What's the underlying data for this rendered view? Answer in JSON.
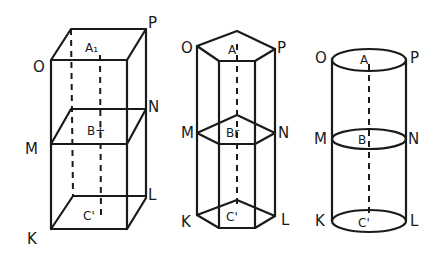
{
  "figures": [
    {
      "name": "rectangular-prism",
      "vertex_labels": {
        "O": "O",
        "P": "P",
        "N": "N",
        "M": "M",
        "L": "L",
        "K": "K"
      },
      "center_labels": {
        "top": "A₁",
        "middle": "B+",
        "bottom": "C'"
      }
    },
    {
      "name": "hexagonal-prism",
      "vertex_labels": {
        "O": "O",
        "P": "P",
        "N": "N",
        "M": "M",
        "L": "L",
        "K": "K"
      },
      "center_labels": {
        "top": "A",
        "middle": "Br",
        "bottom": "C'"
      }
    },
    {
      "name": "cylinder",
      "vertex_labels": {
        "O": "O",
        "P": "P",
        "N": "N",
        "M": "M",
        "L": "L",
        "K": "K"
      },
      "center_labels": {
        "top": "A",
        "middle": "B",
        "bottom": "C'"
      }
    }
  ]
}
